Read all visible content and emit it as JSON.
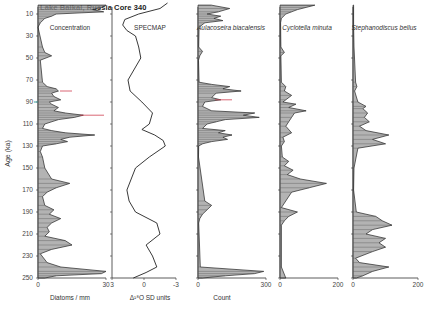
{
  "title": "Lake Baikal, Russia  Core 340",
  "y_axis": {
    "label": "Age (ka)",
    "ticks": [
      10,
      30,
      50,
      70,
      90,
      110,
      130,
      150,
      170,
      190,
      210,
      230,
      250
    ]
  },
  "panels": [
    {
      "title": "Concentration",
      "italic": false,
      "xlabel": "Diatoms / mm",
      "xticks": [
        "0",
        "30"
      ]
    },
    {
      "title": "SPECMAP",
      "italic": false,
      "xlabel": "Δ¹⁸O SD units",
      "xticks": [
        "3",
        "0",
        "-3"
      ]
    },
    {
      "title": "Aulacoseira biacalensis",
      "italic": true,
      "xlabel": "Count",
      "xticks": [
        "0",
        "300"
      ]
    },
    {
      "title": "Cyclotella minuta",
      "italic": true,
      "xlabel": "",
      "xticks": [
        "0",
        "200"
      ]
    },
    {
      "title": "Stephanodiscus bellus",
      "italic": true,
      "xlabel": "",
      "xticks": [
        "0",
        "200"
      ]
    }
  ],
  "colors": {
    "line": "#222222",
    "fill": "#9a9a9a",
    "accent_red": "#d04050",
    "accent_teal": "#40a0a0"
  },
  "chart_data": {
    "type": "area",
    "title": "Lake Baikal, Russia  Core 340",
    "ylabel": "Age (ka)",
    "ylim": [
      0,
      250
    ],
    "y_inverted": true,
    "grid": false,
    "series": [
      {
        "name": "Concentration",
        "xlabel": "Diatoms / mm",
        "xlim": [
          0,
          30
        ],
        "age": [
          2,
          4,
          6,
          8,
          10,
          12,
          14,
          18,
          22,
          40,
          45,
          48,
          52,
          72,
          76,
          78,
          80,
          82,
          85,
          88,
          90,
          92,
          95,
          98,
          100,
          102,
          104,
          106,
          110,
          114,
          116,
          118,
          120,
          122,
          124,
          126,
          128,
          130,
          135,
          140,
          150,
          160,
          164,
          168,
          172,
          176,
          184,
          188,
          192,
          196,
          200,
          204,
          208,
          212,
          216,
          220,
          224,
          228,
          236,
          240,
          244,
          246,
          248,
          250
        ],
        "values": [
          30,
          28,
          24,
          29,
          8,
          6,
          3,
          1,
          0,
          2,
          3,
          6,
          1,
          2,
          4,
          8,
          9,
          6,
          7,
          10,
          5,
          6,
          9,
          7,
          12,
          20,
          16,
          9,
          3,
          2,
          6,
          12,
          25,
          14,
          10,
          13,
          8,
          2,
          1,
          2,
          3,
          6,
          14,
          8,
          4,
          2,
          3,
          7,
          5,
          10,
          6,
          4,
          5,
          3,
          12,
          15,
          6,
          1,
          4,
          10,
          30,
          28,
          8,
          3
        ]
      },
      {
        "name": "SPECMAP",
        "xlabel": "Δ¹⁸O SD units",
        "xlim": [
          3,
          -3
        ],
        "age": [
          0,
          5,
          10,
          15,
          20,
          25,
          30,
          40,
          50,
          60,
          70,
          80,
          90,
          100,
          110,
          115,
          120,
          125,
          130,
          140,
          150,
          160,
          170,
          180,
          190,
          200,
          210,
          220,
          230,
          240,
          245,
          250
        ],
        "values": [
          -2.2,
          -1.5,
          0.5,
          1.8,
          2.0,
          1.6,
          0.8,
          0.5,
          0.3,
          0.9,
          1.5,
          1.3,
          0.2,
          -0.8,
          -0.5,
          0.2,
          -1.0,
          -1.8,
          -2.0,
          -0.5,
          0.8,
          1.2,
          1.6,
          1.4,
          0.8,
          -1.2,
          -1.5,
          -0.2,
          -0.8,
          -1.2,
          -0.2,
          1.0
        ]
      },
      {
        "name": "Aulacoseira biacalensis",
        "xlabel": "Count",
        "xlim": [
          0,
          300
        ],
        "age": [
          2,
          5,
          8,
          10,
          12,
          14,
          16,
          18,
          22,
          40,
          44,
          48,
          52,
          72,
          74,
          76,
          78,
          80,
          82,
          86,
          88,
          90,
          94,
          98,
          100,
          102,
          104,
          106,
          108,
          110,
          114,
          116,
          118,
          120,
          122,
          124,
          126,
          128,
          130,
          140,
          180,
          184,
          188,
          192,
          196,
          200,
          240,
          244,
          246,
          248,
          250
        ],
        "values": [
          60,
          140,
          90,
          40,
          100,
          70,
          110,
          30,
          5,
          3,
          20,
          8,
          2,
          5,
          60,
          140,
          110,
          190,
          80,
          60,
          100,
          30,
          20,
          60,
          250,
          200,
          270,
          120,
          80,
          40,
          20,
          120,
          90,
          150,
          110,
          130,
          60,
          20,
          3,
          2,
          30,
          60,
          40,
          20,
          8,
          3,
          10,
          290,
          250,
          120,
          20
        ]
      },
      {
        "name": "Cyclotella minuta",
        "xlabel": "",
        "xlim": [
          0,
          200
        ],
        "age": [
          2,
          4,
          6,
          8,
          10,
          14,
          18,
          40,
          45,
          48,
          72,
          76,
          80,
          84,
          88,
          90,
          92,
          95,
          98,
          100,
          104,
          108,
          112,
          118,
          122,
          126,
          130,
          140,
          144,
          148,
          152,
          156,
          160,
          164,
          168,
          172,
          186,
          190,
          194,
          198,
          202,
          240,
          250
        ],
        "values": [
          120,
          90,
          60,
          40,
          20,
          5,
          2,
          3,
          15,
          3,
          5,
          20,
          15,
          40,
          20,
          10,
          55,
          30,
          90,
          50,
          40,
          30,
          20,
          40,
          10,
          15,
          5,
          8,
          30,
          15,
          45,
          25,
          70,
          160,
          100,
          40,
          5,
          60,
          30,
          15,
          5,
          5,
          20
        ]
      },
      {
        "name": "Stephanodiscus bellus",
        "xlabel": "",
        "xlim": [
          0,
          200
        ],
        "age": [
          2,
          20,
          40,
          72,
          76,
          80,
          90,
          94,
          96,
          100,
          104,
          108,
          112,
          116,
          120,
          124,
          128,
          132,
          150,
          170,
          190,
          194,
          198,
          202,
          206,
          210,
          214,
          218,
          222,
          226,
          232,
          236,
          240,
          244,
          248,
          250
        ],
        "values": [
          2,
          2,
          3,
          8,
          12,
          5,
          15,
          40,
          30,
          45,
          35,
          50,
          20,
          40,
          110,
          60,
          100,
          15,
          3,
          2,
          10,
          70,
          90,
          120,
          60,
          40,
          100,
          80,
          100,
          60,
          8,
          20,
          110,
          60,
          30,
          10
        ]
      }
    ]
  }
}
